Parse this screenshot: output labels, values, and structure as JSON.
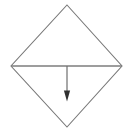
{
  "figure": {
    "canvas": {
      "width": 133,
      "height": 135,
      "background_color": "#ffffff"
    },
    "colors": {
      "outline": "#787878",
      "diagonal": "#7d7d7d",
      "arrow_shaft": "#6e6e6e",
      "arrow_head": "#303030"
    },
    "shapes": {
      "diamond": {
        "name": "rhombus-outline",
        "points": "67,5 122,66 67,127 11,66",
        "stroke_width": 1.1,
        "fill": "none",
        "vertices": {
          "top": [
            67,
            5
          ],
          "right": [
            122,
            66
          ],
          "bottom": [
            67,
            127
          ],
          "left": [
            11,
            66
          ]
        }
      },
      "horizontal_diagonal": {
        "name": "horizontal-diagonal-line",
        "x1": 11,
        "y1": 66,
        "x2": 122,
        "y2": 66,
        "stroke_width": 1.3
      },
      "arrow": {
        "name": "downward-arrow",
        "direction": "down",
        "shaft": {
          "x1": 67,
          "y1": 66,
          "x2": 67,
          "y2": 93,
          "stroke_width": 1.2
        },
        "head": {
          "points": "67,101.5 63.9,90.5 70.1,90.5",
          "width": 6.2,
          "height": 11
        }
      }
    }
  }
}
